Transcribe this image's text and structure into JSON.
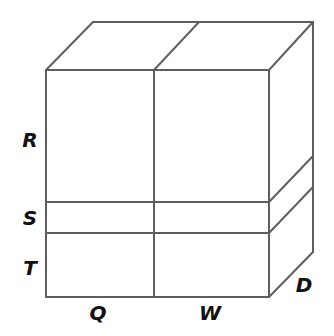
{
  "diagram": {
    "type": "3D box divided into labeled sections",
    "colors": {
      "line": "#5e5e5e",
      "label": "#111111",
      "background": "#ffffff"
    },
    "labels": {
      "height_sections": [
        "R",
        "S",
        "T"
      ],
      "width_sections": [
        "Q",
        "W"
      ],
      "depth": "D"
    }
  }
}
